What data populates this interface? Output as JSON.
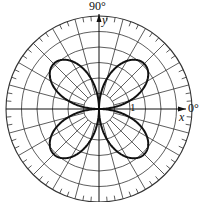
{
  "chart_data": {
    "type": "line",
    "subtype": "polar",
    "title": "",
    "equation_shape": "four-petal rose r = sin(2θ)",
    "angle_labels": {
      "top": "90°",
      "right": "0°"
    },
    "axis_labels": {
      "x": "x",
      "y": "y"
    },
    "radial_tick_label": "1",
    "radial_circles": 6,
    "spoke_step_deg": 15,
    "outer_tick_step_deg": 5,
    "petals": 4,
    "petal_directions_deg": [
      45,
      135,
      225,
      315
    ],
    "max_radius": 1,
    "grid": true,
    "colors": {
      "curve": "#111111",
      "grid": "#333333",
      "background": "#ffffff"
    }
  }
}
